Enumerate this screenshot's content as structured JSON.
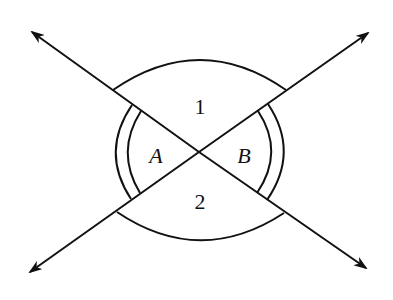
{
  "diagram": {
    "type": "intersecting-lines-angles",
    "stroke_color": "#111111",
    "background": "#ffffff",
    "labels": {
      "top_region": "1",
      "bottom_region": "2",
      "left_angle": "A",
      "right_angle": "B"
    },
    "lines": [
      {
        "name": "line-1",
        "from": [
          32,
          32
        ],
        "to": [
          366,
          268
        ],
        "arrows": "both"
      },
      {
        "name": "line-2",
        "from": [
          30,
          272
        ],
        "to": [
          368,
          33
        ],
        "arrows": "both"
      }
    ],
    "intersection": [
      199,
      152
    ],
    "angle_marks": {
      "top_angle_1": "single arc",
      "bottom_angle_2": "single arc",
      "left_angle_A": "double arc",
      "right_angle_B": "double arc"
    }
  }
}
